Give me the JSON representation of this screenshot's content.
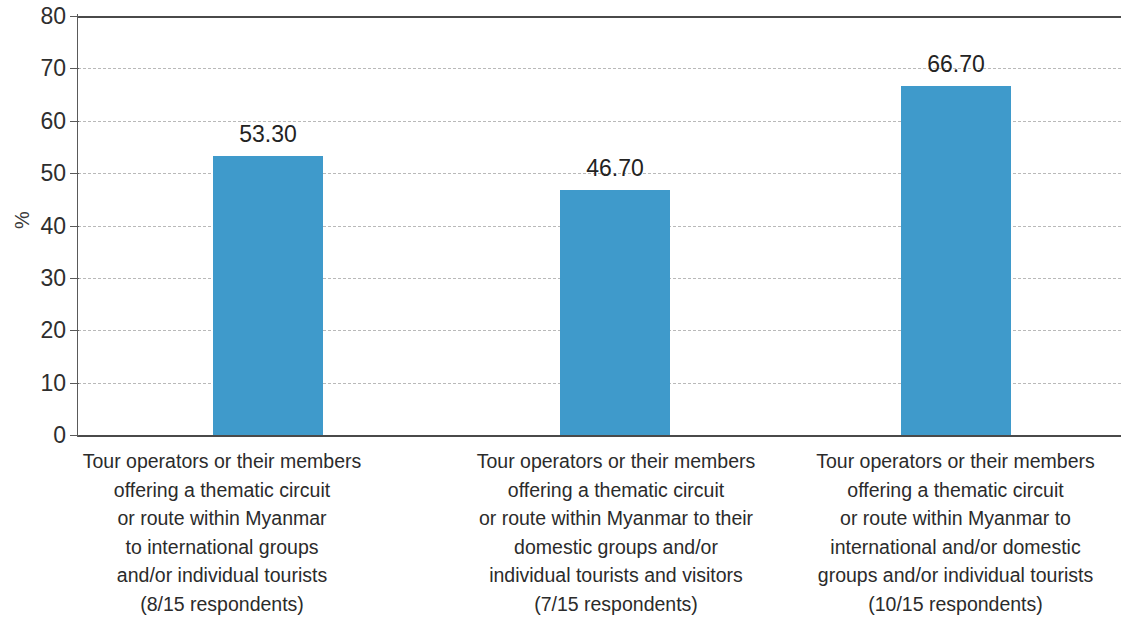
{
  "chart_data": {
    "type": "bar",
    "title": "",
    "subtitle": "",
    "xlabel": "",
    "ylabel": "%",
    "ylim": [
      0,
      80
    ],
    "ytick_values": [
      0,
      10,
      20,
      30,
      40,
      50,
      60,
      70,
      80
    ],
    "ytick_labels": [
      "0",
      "10",
      "20",
      "30",
      "40",
      "50",
      "60",
      "70",
      "80"
    ],
    "grid": "horizontal dashed gridlines at every y tick; solid rules at 0 and 80",
    "legend": "none",
    "bar_color": "#3f9acb",
    "categories": [
      "Tour operators or their members offering a thematic circuit or route within Myanmar to international groups and/or individual tourists (8/15 respondents)",
      "Tour operators or their members offering a thematic circuit or route within Myanmar to their domestic groups and/or individual tourists and visitors (7/15 respondents)",
      "Tour operators or their members offering a thematic circuit or route within Myanmar to international and/or domestic groups and/or individual tourists (10/15 respondents)"
    ],
    "values": [
      53.3,
      46.7,
      66.7
    ],
    "data_labels": [
      "53.30",
      "46.70",
      "66.70"
    ],
    "category_lines": [
      [
        "Tour operators or their members",
        "offering a thematic circuit",
        "or route within Myanmar",
        "to international groups",
        "and/or individual tourists",
        "(8/15 respondents)"
      ],
      [
        "Tour operators or their members",
        "offering a thematic circuit",
        "or route within Myanmar to their",
        "domestic groups and/or",
        "individual tourists and visitors",
        "(7/15 respondents)"
      ],
      [
        "Tour operators or their members",
        "offering a thematic circuit",
        "or route within Myanmar to",
        "international and/or domestic",
        "groups and/or individual tourists",
        "(10/15 respondents)"
      ]
    ]
  }
}
